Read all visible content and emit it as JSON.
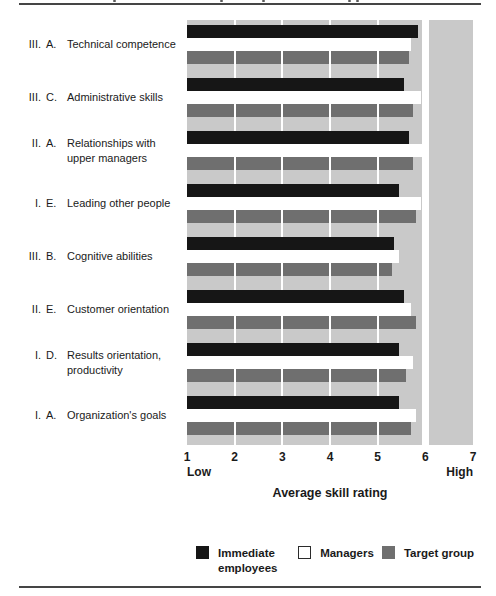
{
  "colors": {
    "bar_black": "#161616",
    "bar_white": "#ffffff",
    "bar_gray": "#6f6f6f",
    "panel_bg": "#c9c9c9",
    "gridline": "#ffffff",
    "rule": "#454545",
    "white_swatch_border": "#2b2b2b"
  },
  "chart_data": {
    "type": "bar",
    "orientation": "horizontal",
    "title": "",
    "xlabel": "Average skill rating",
    "x_axis": {
      "ticks": [
        1,
        2,
        3,
        4,
        5,
        6,
        7
      ],
      "xlim": [
        1,
        7
      ],
      "min_label": "Low",
      "max_label": "High",
      "reference_line_x": 6,
      "gridlines_at": [
        2,
        3,
        4,
        5
      ]
    },
    "legend_position": "bottom",
    "categories": [
      {
        "roman": "III.",
        "letter": "A.",
        "text": "Technical competence"
      },
      {
        "roman": "III.",
        "letter": "C.",
        "text": "Administrative skills"
      },
      {
        "roman": "II.",
        "letter": "A.",
        "text": "Relationships with upper managers"
      },
      {
        "roman": "I.",
        "letter": "E.",
        "text": "Leading other people"
      },
      {
        "roman": "III.",
        "letter": "B.",
        "text": "Cognitive abilities"
      },
      {
        "roman": "II.",
        "letter": "E.",
        "text": "Customer orientation"
      },
      {
        "roman": "I.",
        "letter": "D.",
        "text": "Results orientation, productivity"
      },
      {
        "roman": "I.",
        "letter": "A.",
        "text": "Organization's goals"
      }
    ],
    "series": [
      {
        "name": "Immediate employees",
        "color": "#161616",
        "values": [
          5.85,
          5.55,
          5.65,
          5.45,
          5.35,
          5.55,
          5.45,
          5.45
        ]
      },
      {
        "name": "Managers",
        "color": "#ffffff",
        "values": [
          5.7,
          5.9,
          5.95,
          5.9,
          5.45,
          5.7,
          5.75,
          5.8
        ]
      },
      {
        "name": "Target group",
        "color": "#6f6f6f",
        "values": [
          5.65,
          5.75,
          5.75,
          5.8,
          5.3,
          5.8,
          5.6,
          5.7
        ]
      }
    ]
  }
}
